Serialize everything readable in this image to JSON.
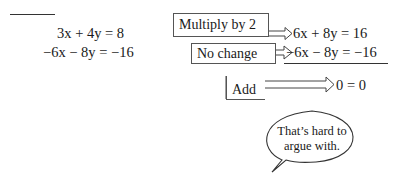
{
  "left_equations": {
    "eq1": "3x + 4y = 8",
    "eq2": "−6x − 8y = −16"
  },
  "steps": [
    {
      "label": "Multiply by 2",
      "result": "6x + 8y = 16"
    },
    {
      "label": "No change",
      "result": "−6x − 8y = −16"
    },
    {
      "label": "Add",
      "result": "0 = 0"
    }
  ],
  "speech_bubble": {
    "line1": "That’s hard to",
    "line2": "argue with."
  },
  "colors": {
    "ink": "#1a1a1a",
    "outline": "#555555",
    "background": "#ffffff"
  }
}
